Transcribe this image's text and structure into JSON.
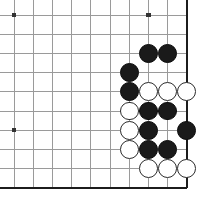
{
  "board": {
    "title": "Go board corner position",
    "type": "go-goban",
    "columns": 10,
    "rows": 10,
    "cell_size": 19.2,
    "origin_x": 14,
    "origin_y": 15,
    "stone_radius": 9.4,
    "colors": {
      "background": "#ffffff",
      "grid_line": "#9a9a9a",
      "edge_line": "#1c1c1c",
      "black_stone": "#1a1a1a",
      "white_stone": "#ffffff",
      "white_stone_border": "#2b2b2b",
      "star_point": "#333333"
    },
    "edges": {
      "right_border": true,
      "bottom_border": true,
      "left_border": false,
      "top_border": false
    },
    "star_points": [
      {
        "col": 0,
        "row": 0
      },
      {
        "col": 7,
        "row": 0
      },
      {
        "col": 0,
        "row": 6
      }
    ],
    "stones": [
      {
        "color": "black",
        "col": 7,
        "row": 2
      },
      {
        "color": "black",
        "col": 8,
        "row": 2
      },
      {
        "color": "black",
        "col": 6,
        "row": 3
      },
      {
        "color": "black",
        "col": 6,
        "row": 4
      },
      {
        "color": "white",
        "col": 7,
        "row": 4
      },
      {
        "color": "white",
        "col": 8,
        "row": 4
      },
      {
        "color": "white",
        "col": 9,
        "row": 4
      },
      {
        "color": "white",
        "col": 6,
        "row": 5
      },
      {
        "color": "black",
        "col": 7,
        "row": 5
      },
      {
        "color": "black",
        "col": 8,
        "row": 5
      },
      {
        "color": "white",
        "col": 6,
        "row": 6
      },
      {
        "color": "black",
        "col": 7,
        "row": 6
      },
      {
        "color": "black",
        "col": 9,
        "row": 6
      },
      {
        "color": "white",
        "col": 6,
        "row": 7
      },
      {
        "color": "black",
        "col": 7,
        "row": 7
      },
      {
        "color": "black",
        "col": 8,
        "row": 7
      },
      {
        "color": "white",
        "col": 7,
        "row": 8
      },
      {
        "color": "white",
        "col": 8,
        "row": 8
      },
      {
        "color": "white",
        "col": 9,
        "row": 8
      }
    ]
  }
}
